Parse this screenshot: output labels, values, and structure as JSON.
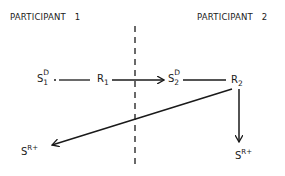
{
  "participants": {
    "left": {
      "label": "PARTICIPANT   1"
    },
    "right": {
      "label": "PARTICIPANT   2"
    }
  },
  "nodes": {
    "s1d": {
      "base": "S",
      "sup": "D",
      "sub": "1"
    },
    "r1": {
      "base": "R",
      "sub": "1"
    },
    "s2d": {
      "base": "S",
      "sup": "D",
      "sub": "2"
    },
    "r2": {
      "base": "R",
      "sub": "2"
    },
    "sr_left": {
      "base": "S",
      "sup": "R+"
    },
    "sr_right": {
      "base": "S",
      "sup": "R+"
    }
  },
  "edges": [
    {
      "from": "s1d",
      "to": "r1",
      "style": "line"
    },
    {
      "from": "r1",
      "to": "s2d",
      "style": "arrow"
    },
    {
      "from": "s2d",
      "to": "r2",
      "style": "line"
    },
    {
      "from": "r2",
      "to": "sr_right",
      "style": "arrow"
    },
    {
      "from": "r2",
      "to": "sr_left",
      "style": "arrow"
    }
  ],
  "divider": {
    "style": "dashed"
  },
  "colors": {
    "ink": "#1a1a1a",
    "background": "#ffffff"
  }
}
